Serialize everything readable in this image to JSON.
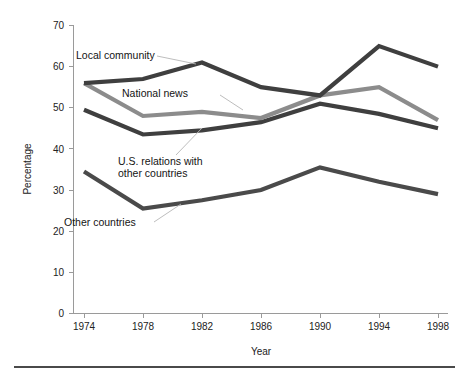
{
  "chart_data": {
    "type": "line",
    "title": "",
    "xlabel": "Year",
    "ylabel": "Percentage",
    "categories": [
      "1974",
      "1978",
      "1982",
      "1986",
      "1990",
      "1994",
      "1998"
    ],
    "x": [
      1974,
      1978,
      1982,
      1986,
      1990,
      1994,
      1998
    ],
    "xlim": [
      1972,
      2000
    ],
    "ylim": [
      0,
      70
    ],
    "ytick_labels": [
      "0",
      "10",
      "20",
      "30",
      "40",
      "50",
      "60",
      "70"
    ],
    "yticks": [
      0,
      10,
      20,
      30,
      40,
      50,
      60,
      70
    ],
    "grid": false,
    "legend_position": "inline-annotations",
    "series": [
      {
        "name": "Local community",
        "color": "#3f3f3f",
        "values": [
          56,
          57,
          61,
          55,
          53,
          65,
          60
        ]
      },
      {
        "name": "National news",
        "color": "#8c8c8c",
        "values": [
          56,
          48,
          49,
          47.5,
          53,
          55,
          47
        ]
      },
      {
        "name": "U.S. relations with other countries",
        "color": "#3f3f3f",
        "values": [
          49.5,
          43.5,
          44.5,
          46.5,
          51,
          48.5,
          45
        ]
      },
      {
        "name": "Other countries",
        "color": "#4a4a4a",
        "values": [
          34.5,
          25.5,
          27.5,
          30,
          35.5,
          32,
          29
        ]
      }
    ],
    "annotations": [
      {
        "text": "Local community",
        "for_series": "Local community"
      },
      {
        "text": "National news",
        "for_series": "National news"
      },
      {
        "text": "U.S. relations with",
        "for_series": "U.S. relations with other countries"
      },
      {
        "text": "other countries",
        "for_series": "U.S. relations with other countries"
      },
      {
        "text": "Other countries",
        "for_series": "Other countries"
      }
    ]
  }
}
